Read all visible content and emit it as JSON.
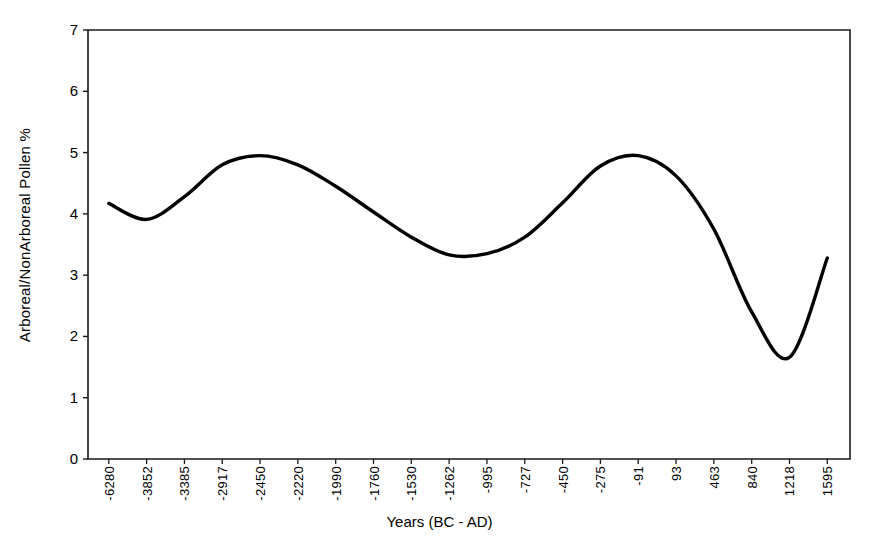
{
  "chart_data": {
    "type": "line",
    "title": "",
    "xlabel": "Years (BC - AD)",
    "ylabel": "Arboreal/NonArboreal Pollen %",
    "xlim": [
      0,
      20
    ],
    "ylim": [
      0,
      7
    ],
    "grid": false,
    "legend": null,
    "line_color": "#000000",
    "categories": [
      "-6280",
      "-3852",
      "-3385",
      "-2917",
      "-2450",
      "-2220",
      "-1990",
      "-1760",
      "-1530",
      "-1262",
      "-995",
      "-727",
      "-450",
      "-275",
      "-91",
      "93",
      "463",
      "840",
      "1218",
      "1595"
    ],
    "x_tick_labels": [
      "-6280",
      "-3852",
      "-3385",
      "-2917",
      "-2450",
      "-2220",
      "-1990",
      "-1760",
      "-1530",
      "-1262",
      "-995",
      "-727",
      "-450",
      "-275",
      "-91",
      "93",
      "463",
      "840",
      "1218",
      "1595"
    ],
    "y_tick_labels": [
      "0",
      "1",
      "2",
      "3",
      "4",
      "5",
      "6",
      "7"
    ],
    "y_ticks": [
      0,
      1,
      2,
      3,
      4,
      5,
      6,
      7
    ],
    "values": [
      4.17,
      3.91,
      4.28,
      4.8,
      4.95,
      4.8,
      4.45,
      4.03,
      3.62,
      3.33,
      3.35,
      3.62,
      4.18,
      4.78,
      4.95,
      4.62,
      3.75,
      2.4,
      1.66,
      3.28
    ],
    "series": [
      {
        "name": "Arboreal/NonArboreal Pollen %",
        "values": [
          4.17,
          3.91,
          4.28,
          4.8,
          4.95,
          4.8,
          4.45,
          4.03,
          3.62,
          3.33,
          3.35,
          3.62,
          4.18,
          4.78,
          4.95,
          4.62,
          3.75,
          2.4,
          1.66,
          3.28
        ]
      }
    ],
    "annotations": []
  }
}
